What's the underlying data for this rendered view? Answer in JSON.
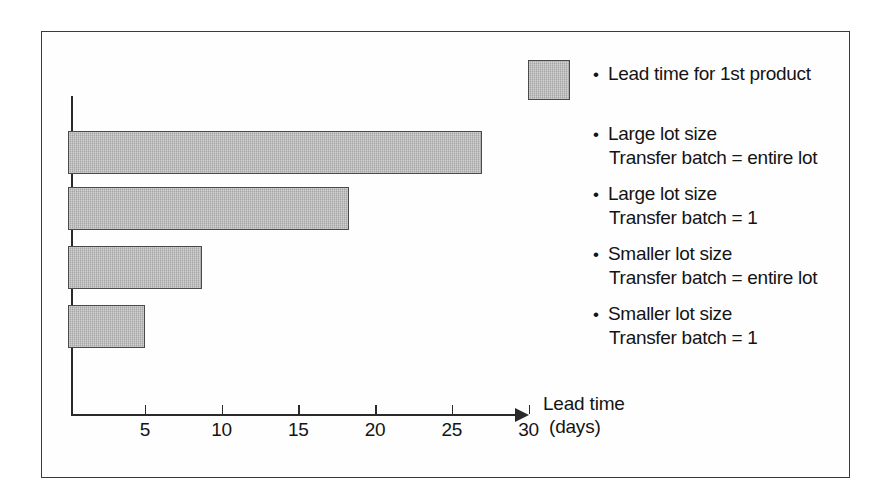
{
  "chart_data": {
    "type": "bar",
    "orientation": "horizontal",
    "title": "",
    "xlabel_line1": "Lead time",
    "xlabel_line2": "(days)",
    "ylabel": "",
    "xlim": [
      0,
      32
    ],
    "xticks": [
      5,
      10,
      15,
      20,
      25,
      30
    ],
    "xtick_labels": [
      "5",
      "10",
      "15",
      "20",
      "25",
      "30"
    ],
    "grid": false,
    "legend_position": "right",
    "bar_fill_color": "#b6b6b6",
    "bar_edge_color": "#4a4a4a",
    "axis_color": "#2a2a2a",
    "categories": [
      "Large lot size, Transfer batch = entire lot",
      "Large lot size, Transfer batch = 1",
      "Smaller lot size, Transfer batch = entire lot",
      "Smaller lot size, Transfer batch = 1"
    ],
    "values": [
      27,
      18.3,
      8.7,
      5
    ],
    "series": [
      {
        "name": "Lead time for 1st product",
        "values": [
          27,
          18.3,
          8.7,
          5
        ]
      }
    ]
  },
  "axis": {
    "ticks": [
      {
        "label": "5",
        "value": 5
      },
      {
        "label": "10",
        "value": 10
      },
      {
        "label": "15",
        "value": 15
      },
      {
        "label": "20",
        "value": 20
      },
      {
        "label": "25",
        "value": 25
      },
      {
        "label": "30",
        "value": 30
      }
    ],
    "title_line1": "Lead time",
    "title_line2": "(days)"
  },
  "legend": {
    "swatch_color": "#b6b6b6",
    "bullet": "•",
    "entries": [
      {
        "line1": "Lead time for 1st product",
        "line2": ""
      },
      {
        "line1": "Large lot size",
        "line2": "Transfer batch = entire lot"
      },
      {
        "line1": "Large lot size",
        "line2": "Transfer batch = 1"
      },
      {
        "line1": "Smaller lot size",
        "line2": "Transfer batch = entire lot"
      },
      {
        "line1": "Smaller lot size",
        "line2": "Transfer batch = 1"
      }
    ]
  }
}
